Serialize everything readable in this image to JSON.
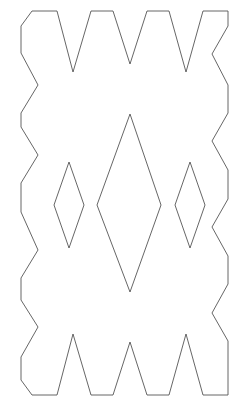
{
  "figure": {
    "background_color": "#ffffff",
    "stroke_color": "#555555",
    "stroke_width": 0.9,
    "fill_color": "#ffffff",
    "canvas": {
      "width": 242,
      "height": 413
    },
    "shapes": {
      "outer_outline": {
        "name": "jagged-star-outline",
        "points": "32,11 57,11 73,72 91,11 113,11 130,64 147,11 169,11 186,72 203,11 228,11 228,26 212,54 228,85 228,113 212,141 228,170 228,199 212,227 228,256 228,284 212,313 228,341 228,370 228,395 203,395 186,334 169,395 147,395 130,342 113,395 91,395 73,334 57,395 32,395 21,380 21,357 38,327 21,300 21,278 38,250 21,212 21,183 38,155 21,127 21,113 38,85 21,53 21,26"
      },
      "center_diamond": {
        "name": "center-diamond",
        "points": "130,114 161,205 130,292 97,205"
      },
      "left_diamond": {
        "name": "left-small-diamond",
        "points": "69,162 84,205 69,248 54,205"
      },
      "right_diamond": {
        "name": "right-small-diamond",
        "points": "190,162 205,205 190,248 175,205"
      }
    }
  }
}
